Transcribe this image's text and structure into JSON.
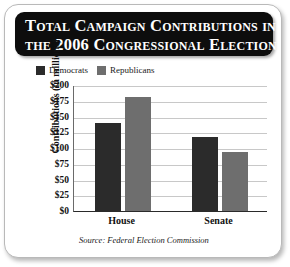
{
  "title": {
    "line1": "Total Campaign Contributions in",
    "line2": "the 2006 Congressional Election"
  },
  "legend": {
    "position": "top-left",
    "entries": [
      {
        "label": "Democrats",
        "color": "#2b2b2b"
      },
      {
        "label": "Republicans",
        "color": "#6e6e6e"
      }
    ]
  },
  "source": "Source: Federal Election Commission",
  "axes": {
    "ylabel": "Contributions (in millions)",
    "yticks": [
      "$200",
      "$175",
      "$150",
      "$125",
      "$100",
      "$75",
      "$50",
      "$25",
      "$0"
    ],
    "xticks": [
      "House",
      "Senate"
    ]
  },
  "chart_data": {
    "type": "bar",
    "title": "Total Campaign Contributions in the 2006 Congressional Election",
    "subtitle": "",
    "xlabel": "",
    "ylabel": "Contributions (in millions)",
    "categories": [
      "House",
      "Senate"
    ],
    "series": [
      {
        "name": "Democrats",
        "color": "#2b2b2b",
        "values": [
          139,
          118
        ]
      },
      {
        "name": "Republicans",
        "color": "#6e6e6e",
        "values": [
          181,
          93
        ]
      }
    ],
    "ylim": [
      0,
      200
    ],
    "ytick_values": [
      0,
      25,
      50,
      75,
      100,
      125,
      150,
      175,
      200
    ],
    "ytick_labels": [
      "$0",
      "$25",
      "$50",
      "$75",
      "$100",
      "$125",
      "$150",
      "$175",
      "$200"
    ],
    "value_prefix": "$",
    "units": "millions of dollars",
    "grid": true,
    "grid_axis": "y",
    "legend": true,
    "legend_position": "above-plot-left",
    "annotations": [
      "Source: Federal Election Commission"
    ]
  }
}
